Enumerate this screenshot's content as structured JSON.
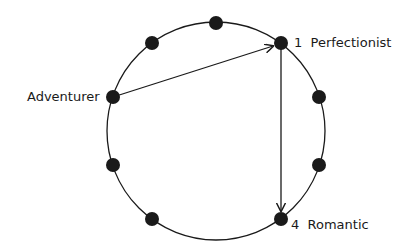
{
  "diagram": {
    "title": "",
    "circle": {
      "cx": 216,
      "cy": 131,
      "r": 109
    },
    "nodes": [
      {
        "id": "top",
        "x": 216,
        "y": 23
      },
      {
        "id": "upper-left",
        "x": 152,
        "y": 43
      },
      {
        "id": "perfectionist",
        "x": 281,
        "y": 43,
        "number": "1",
        "name": "Perfectionist"
      },
      {
        "id": "adventurer",
        "x": 113,
        "y": 97,
        "number": "7",
        "name": "Adventurer"
      },
      {
        "id": "right-upper",
        "x": 319,
        "y": 97
      },
      {
        "id": "left-lower",
        "x": 113,
        "y": 165
      },
      {
        "id": "right-lower",
        "x": 319,
        "y": 165
      },
      {
        "id": "bottom-left",
        "x": 152,
        "y": 219
      },
      {
        "id": "romantic",
        "x": 281,
        "y": 219,
        "number": "4",
        "name": "Romantic"
      }
    ],
    "arrows": [
      {
        "from": "adventurer",
        "to": "perfectionist"
      },
      {
        "from": "perfectionist",
        "to": "romantic"
      }
    ],
    "labels": {
      "perfectionist": "1  Perfectionist",
      "adventurer": "Adventurer  7",
      "romantic": "4  Romantic"
    },
    "colors": {
      "stroke": "#1a1a1a",
      "node": "#1a1a1a",
      "background": "#ffffff"
    }
  }
}
